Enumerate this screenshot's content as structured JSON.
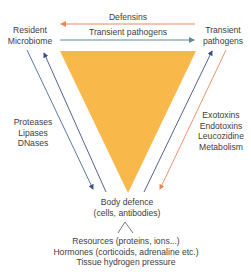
{
  "nodes": {
    "resident": {
      "line1": "Resident",
      "line2": "Microbiome"
    },
    "transient": {
      "line1": "Transient",
      "line2": "pathogens"
    },
    "body_defence": {
      "line1": "Body defence",
      "line2": "(cells, antibodies)"
    }
  },
  "arrows": {
    "top_left": "Defensins",
    "top_right": "Transient pathogens"
  },
  "left_factors": [
    "Proteases",
    "Lipases",
    "DNases"
  ],
  "right_factors": [
    "Exotoxins",
    "Endotoxins",
    "Leucozidine",
    "Metabolism"
  ],
  "bottom_factors": [
    "Resources (proteins, ions...)",
    "Hormones (corticoids, adrenaline etc.)",
    "Tissue hydrogen pressure"
  ],
  "colors": {
    "triangle": "#F9B84A",
    "orange_arrow": "#E8875A",
    "blue_arrow": "#3F4F86",
    "teal_arrow": "#5E8A9A",
    "gray_line": "#6B7A8F"
  }
}
